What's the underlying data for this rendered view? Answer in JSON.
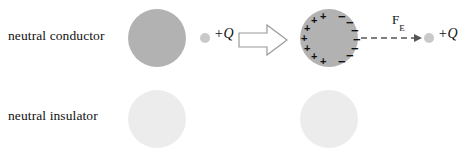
{
  "figure": {
    "background_color": "#ffffff"
  },
  "colors": {
    "conductor_fill": "#b2b2b2",
    "insulator_fill": "#ececec",
    "point_charge_fill": "#c9c9c9",
    "text": "#111111",
    "arrow_stroke": "#9a9a9a",
    "force_arrow_stroke": "#555555",
    "dipole_stroke": "#2b2b2b"
  },
  "rows": [
    {
      "id": "conductor",
      "label": "neutral conductor",
      "before": {
        "sphere_state": "neutral",
        "point_charge_label": "+Q"
      },
      "transition_icon": "block-arrow-right-icon",
      "after": {
        "sphere_state": "polarized-induced-charge",
        "positive_marks": [
          "+",
          "+",
          "+",
          "+",
          "+",
          "+",
          "+"
        ],
        "negative_marks": [
          "−",
          "−",
          "−",
          "−",
          "−",
          "−",
          "−"
        ],
        "positive_side": "left",
        "negative_side": "right",
        "force_label": "F",
        "force_subscript": "E",
        "force_arrow": "dashed-arrow-right-icon",
        "force_magnitude_note": "long",
        "point_charge_label": "+Q"
      }
    },
    {
      "id": "insulator",
      "label": "neutral insulator",
      "before": {
        "sphere_state": "neutral",
        "point_charge_label": "+Q"
      },
      "transition_icon": "block-arrow-right-icon",
      "after": {
        "sphere_state": "polarized-molecular-dipoles",
        "dipole_count": 4,
        "dipoles": [
          {
            "left_symbol": "δ",
            "left_sign": "+",
            "right_symbol": "δ",
            "right_sign": "−"
          },
          {
            "left_symbol": "δ",
            "left_sign": "+",
            "right_symbol": "δ",
            "right_sign": "−"
          },
          {
            "left_symbol": "δ",
            "left_sign": "+",
            "right_symbol": "δ",
            "right_sign": "−"
          },
          {
            "left_symbol": "δ",
            "left_sign": "+",
            "right_symbol": "δ",
            "right_sign": "−"
          }
        ],
        "force_label": "F",
        "force_subscript": "E",
        "force_arrow": "dashed-arrow-right-icon",
        "force_magnitude_note": "short",
        "point_charge_label": "+Q"
      }
    }
  ]
}
